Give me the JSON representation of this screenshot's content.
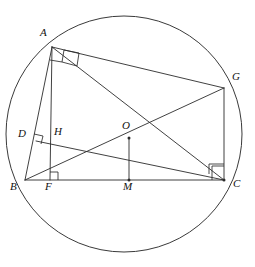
{
  "figure": {
    "background_color": "#ffffff",
    "stroke_color": "#2b2b2b"
  },
  "circle": {
    "name": "circumcircle",
    "center_x": 124,
    "center_y": 134,
    "radius": 118
  },
  "points": [
    {
      "id": "A",
      "label": "A",
      "x": 52,
      "y": 47,
      "label_x": 40,
      "label_y": 27,
      "dot": false
    },
    {
      "id": "G",
      "label": "G",
      "x": 224,
      "y": 88,
      "label_x": 232,
      "label_y": 71,
      "dot": false
    },
    {
      "id": "D",
      "label": "D",
      "x": 36,
      "y": 141,
      "label_x": 18,
      "label_y": 128,
      "dot": false
    },
    {
      "id": "H",
      "label": "H",
      "x": 58,
      "y": 141,
      "label_x": 54,
      "label_y": 126,
      "dot": false
    },
    {
      "id": "O",
      "label": "O",
      "x": 129,
      "y": 138,
      "label_x": 122,
      "label_y": 120,
      "dot": true
    },
    {
      "id": "B",
      "label": "B",
      "x": 25,
      "y": 180,
      "label_x": 10,
      "label_y": 181,
      "dot": false
    },
    {
      "id": "F",
      "label": "F",
      "x": 50,
      "y": 180,
      "label_x": 45,
      "label_y": 181,
      "dot": false
    },
    {
      "id": "M",
      "label": "M",
      "x": 129,
      "y": 180,
      "label_x": 123,
      "label_y": 181,
      "dot": true
    },
    {
      "id": "C",
      "label": "C",
      "x": 224,
      "y": 180,
      "label_x": 233,
      "label_y": 178,
      "dot": true
    }
  ],
  "segments": [
    {
      "name": "segment-AB",
      "from": "A",
      "to": "B"
    },
    {
      "name": "segment-AF",
      "from": "A",
      "to": "F"
    },
    {
      "name": "segment-AG",
      "from": "A",
      "to": "G"
    },
    {
      "name": "segment-AC",
      "from": "A",
      "to": "C"
    },
    {
      "name": "segment-BC",
      "from": "B",
      "to": "C"
    },
    {
      "name": "segment-BG",
      "from": "B",
      "to": "G"
    },
    {
      "name": "segment-GC",
      "from": "G",
      "to": "C"
    },
    {
      "name": "segment-DC",
      "from": "D",
      "to": "C"
    },
    {
      "name": "segment-OM",
      "from": "O",
      "to": "M"
    }
  ],
  "right_angle_marks": [
    {
      "name": "right-angle-at-A",
      "vertex": "A",
      "size": 10
    },
    {
      "name": "right-angle-at-D",
      "vertex": "D",
      "size": 7
    },
    {
      "name": "right-angle-at-F",
      "vertex": "F",
      "size": 7
    },
    {
      "name": "right-angle-at-C",
      "vertex": "C",
      "size": 11
    }
  ]
}
